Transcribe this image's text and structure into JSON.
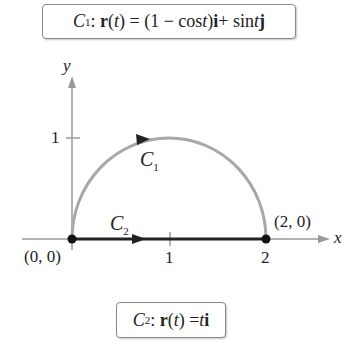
{
  "equations": {
    "c1": {
      "name": "C",
      "sub": "1",
      "lhs": ": r(t) = ",
      "rhs": "(1 − cos t)i + sin tj"
    },
    "c2": {
      "name": "C",
      "sub": "2",
      "lhs": ": r(t) = ",
      "rhs": "ti"
    }
  },
  "axes": {
    "x_label": "x",
    "y_label": "y",
    "x_ticks": [
      "1",
      "2"
    ],
    "y_ticks": [
      "1"
    ]
  },
  "points": {
    "origin": "(0, 0)",
    "end": "(2, 0)"
  },
  "curves": {
    "c1_label": "C",
    "c1_sub": "1",
    "c2_label": "C",
    "c2_sub": "2"
  },
  "colors": {
    "semicircle": "#a8a8a8",
    "segment": "#222222",
    "axis": "#9a9a9a"
  }
}
